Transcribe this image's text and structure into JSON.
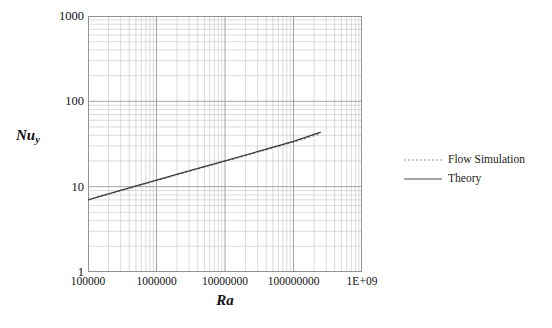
{
  "chart_data": {
    "type": "line",
    "title": "",
    "subtitle": "",
    "xlabel": "Ra",
    "ylabel": "Nu_y",
    "ylabel_base": "Nu",
    "ylabel_sub": "y",
    "xscale": "log",
    "yscale": "log",
    "xlim": [
      100000,
      1000000000
    ],
    "ylim": [
      1,
      1000
    ],
    "grid": "major and minor log grid on both axes",
    "legend_position": "right",
    "xticks": [
      "100000",
      "1000000",
      "10000000",
      "100000000",
      "1E+09"
    ],
    "xtick_values": [
      100000,
      1000000,
      10000000,
      100000000,
      1000000000
    ],
    "yticks": [
      "1000",
      "100",
      "10",
      "1"
    ],
    "ytick_values": [
      1000,
      100,
      10,
      1
    ],
    "series": [
      {
        "name": "Flow Simulation",
        "style": "dotted",
        "color": "#8c8c8c",
        "x": [
          100000,
          316228,
          1000000,
          3162278,
          10000000,
          31622777,
          100000000,
          250000000
        ],
        "y": [
          7.0,
          9.1,
          11.8,
          15.3,
          19.8,
          25.7,
          33.3,
          42.0
        ]
      },
      {
        "name": "Theory",
        "style": "solid",
        "color": "#3a3a3a",
        "x": [
          100000,
          316228,
          1000000,
          3162278,
          10000000,
          31622777,
          100000000,
          250000000
        ],
        "y": [
          7.0,
          9.15,
          11.9,
          15.5,
          20.1,
          26.1,
          34.0,
          43.5
        ]
      }
    ],
    "grid_color": "#9a9a9a",
    "minor_grid_color": "#c2c2c2",
    "axis_color": "#808080",
    "background": "#ffffff"
  },
  "legend": {
    "items": [
      {
        "label": "Flow Simulation",
        "style": "dotted",
        "color": "#8c8c8c"
      },
      {
        "label": "Theory",
        "style": "solid",
        "color": "#4a4a4a"
      }
    ]
  }
}
